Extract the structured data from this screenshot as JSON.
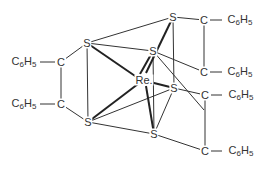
{
  "molecule": {
    "title": "Tris(dithiolene) rhenium complex",
    "center_atom": "Re",
    "atoms": [
      {
        "id": "Re",
        "label": "Re.",
        "x": 144,
        "y": 80
      },
      {
        "id": "S1",
        "label": "S",
        "x": 87,
        "y": 43
      },
      {
        "id": "S2",
        "label": "S",
        "x": 88,
        "y": 122
      },
      {
        "id": "S3",
        "label": "S",
        "x": 173,
        "y": 17
      },
      {
        "id": "S4",
        "label": "S",
        "x": 153,
        "y": 51
      },
      {
        "id": "S5",
        "label": "S",
        "x": 174,
        "y": 88
      },
      {
        "id": "S6",
        "label": "S",
        "x": 154,
        "y": 134
      },
      {
        "id": "C1",
        "label": "C",
        "x": 61,
        "y": 62
      },
      {
        "id": "C2",
        "label": "C",
        "x": 61,
        "y": 104
      },
      {
        "id": "C3",
        "label": "C",
        "x": 204,
        "y": 20
      },
      {
        "id": "C4",
        "label": "C",
        "x": 204,
        "y": 72
      },
      {
        "id": "C5",
        "label": "C",
        "x": 205,
        "y": 95
      },
      {
        "id": "C6",
        "label": "C",
        "x": 205,
        "y": 151
      }
    ],
    "substituents": [
      {
        "label": "C6H5",
        "x": 24,
        "y": 62
      },
      {
        "label": "C6H5",
        "x": 24,
        "y": 104
      },
      {
        "label": "C6H5",
        "x": 238,
        "y": 20
      },
      {
        "label": "C6H5",
        "x": 238,
        "y": 72
      },
      {
        "label": "C6H5",
        "x": 238,
        "y": 95
      },
      {
        "label": "C6H5",
        "x": 238,
        "y": 151
      }
    ]
  }
}
